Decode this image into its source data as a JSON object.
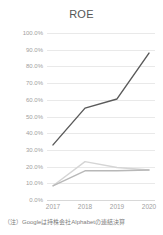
{
  "chart_data": {
    "type": "line",
    "title": "ROE",
    "xlabel": "",
    "ylabel": "",
    "categories": [
      "2017",
      "2018",
      "2019",
      "2020"
    ],
    "ylim": [
      0,
      100
    ],
    "ytick_labels": [
      "100.0%",
      "90.0%",
      "80.0%",
      "70.0%",
      "60.0%",
      "50.0%",
      "40.0%",
      "30.0%",
      "20.0%",
      "10.0%",
      "0.0%"
    ],
    "ytick_values": [
      100,
      90,
      80,
      70,
      60,
      50,
      40,
      30,
      20,
      10,
      0
    ],
    "grid": true,
    "legend": "none",
    "series": [
      {
        "name": "series-1",
        "color": "#5a5a5a",
        "values": [
          33.0,
          55.0,
          60.5,
          88.0
        ]
      },
      {
        "name": "series-2",
        "color": "#d5d5d5",
        "values": [
          8.5,
          23.0,
          19.5,
          18.0
        ]
      },
      {
        "name": "series-3",
        "color": "#b8b8b8",
        "values": [
          8.5,
          17.5,
          17.5,
          18.0
        ]
      }
    ],
    "annotations": [
      "（注）Googleは持株会社Alphabetの連結決算"
    ]
  },
  "footnote": {
    "text": "（注）Googleは持株会社Alphabetの連結決算"
  },
  "colors": {
    "grid": "#e9e9e9",
    "tick_text": "#a0a0a0",
    "title_text": "#555555"
  }
}
